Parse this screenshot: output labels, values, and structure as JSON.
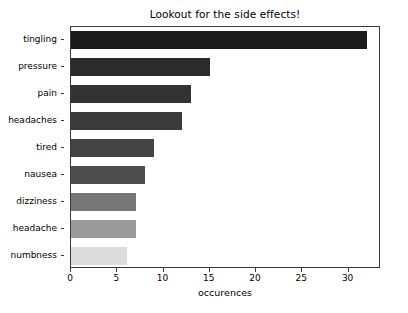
{
  "chart_data": {
    "type": "bar",
    "orientation": "horizontal",
    "title": "Lookout for the side effects!",
    "xlabel": "occurences",
    "ylabel": "",
    "categories": [
      "tingling",
      "pressure",
      "pain",
      "headaches",
      "tired",
      "nausea",
      "dizziness",
      "headache",
      "numbness"
    ],
    "values": [
      32,
      15,
      13,
      12,
      9,
      8,
      7,
      7,
      6
    ],
    "colors": [
      "#1a1a1a",
      "#2b2b2b",
      "#333333",
      "#3b3b3b",
      "#444444",
      "#4d4d4d",
      "#767676",
      "#9a9a9a",
      "#dcdcdc"
    ],
    "xlim": [
      0,
      33.5
    ],
    "xticks": [
      0,
      5,
      10,
      15,
      20,
      25,
      30
    ],
    "xticklabels": [
      "0",
      "5",
      "10",
      "15",
      "20",
      "25",
      "30"
    ],
    "grid": false,
    "legend": null
  }
}
